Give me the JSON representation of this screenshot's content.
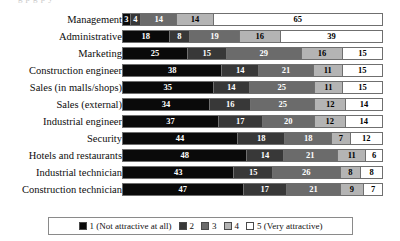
{
  "caption_remnant": "g   p   g   p   y",
  "legend": {
    "position": "bottom",
    "items": [
      {
        "key": "1",
        "label": "1 (Not attractive at all)",
        "color": "#0a0a0a",
        "icon": "legend-swatch-icon"
      },
      {
        "key": "2",
        "label": "2",
        "color": "#383838",
        "icon": "legend-swatch-icon"
      },
      {
        "key": "3",
        "label": "3",
        "color": "#6b6b6b",
        "icon": "legend-swatch-icon"
      },
      {
        "key": "4",
        "label": "4",
        "color": "#b4b4b4",
        "icon": "legend-swatch-icon"
      },
      {
        "key": "5",
        "label": "5 (Very attractive)",
        "color": "#ffffff",
        "icon": "legend-swatch-icon"
      }
    ]
  },
  "chart_data": {
    "type": "bar",
    "orientation": "horizontal",
    "stacked": true,
    "normalized_percent": true,
    "title": "",
    "xlabel": "",
    "ylabel": "",
    "xlim": [
      0,
      100
    ],
    "grid": false,
    "legend_position": "bottom",
    "categories": [
      "Management",
      "Administrative",
      "Marketing",
      "Construction engineer",
      "Sales (in malls/shops)",
      "Sales (external)",
      "Industrial engineer",
      "Security",
      "Hotels and restaurants",
      "Industrial technician",
      "Construction technician"
    ],
    "series": [
      {
        "name": "1 (Not attractive at all)",
        "color": "#0a0a0a",
        "values": [
          3,
          18,
          25,
          38,
          35,
          34,
          37,
          44,
          48,
          43,
          47
        ]
      },
      {
        "name": "2",
        "color": "#383838",
        "values": [
          4,
          8,
          15,
          14,
          14,
          16,
          17,
          18,
          14,
          15,
          17
        ]
      },
      {
        "name": "3",
        "color": "#6b6b6b",
        "values": [
          14,
          19,
          29,
          21,
          25,
          25,
          20,
          18,
          21,
          26,
          21
        ]
      },
      {
        "name": "4",
        "color": "#b4b4b4",
        "values": [
          14,
          16,
          16,
          11,
          11,
          12,
          12,
          7,
          11,
          8,
          9
        ]
      },
      {
        "name": "5 (Very attractive)",
        "color": "#ffffff",
        "values": [
          65,
          39,
          15,
          15,
          15,
          14,
          14,
          12,
          6,
          8,
          7
        ]
      }
    ],
    "rows": [
      {
        "label": "Management",
        "segments": [
          3,
          4,
          14,
          14,
          65
        ]
      },
      {
        "label": "Administrative",
        "segments": [
          18,
          8,
          19,
          16,
          39
        ]
      },
      {
        "label": "Marketing",
        "segments": [
          25,
          15,
          29,
          16,
          15
        ]
      },
      {
        "label": "Construction engineer",
        "segments": [
          38,
          14,
          21,
          11,
          15
        ]
      },
      {
        "label": "Sales (in malls/shops)",
        "segments": [
          35,
          14,
          25,
          11,
          15
        ]
      },
      {
        "label": "Sales (external)",
        "segments": [
          34,
          16,
          25,
          12,
          14
        ]
      },
      {
        "label": "Industrial engineer",
        "segments": [
          37,
          17,
          20,
          12,
          14
        ]
      },
      {
        "label": "Security",
        "segments": [
          44,
          18,
          18,
          7,
          12
        ]
      },
      {
        "label": "Hotels and restaurants",
        "segments": [
          48,
          14,
          21,
          11,
          6
        ]
      },
      {
        "label": "Industrial technician",
        "segments": [
          43,
          15,
          26,
          8,
          8
        ]
      },
      {
        "label": "Construction technician",
        "segments": [
          47,
          17,
          21,
          9,
          7
        ]
      }
    ]
  }
}
